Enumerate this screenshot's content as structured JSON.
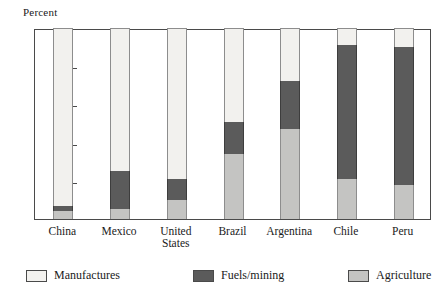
{
  "chart_data": {
    "type": "bar",
    "title": "",
    "subtitle": "",
    "xlabel": "",
    "ylabel": "Percent",
    "ylim": [
      0,
      100
    ],
    "yticks": [
      20,
      40,
      60,
      80
    ],
    "ytick_labels": [
      "20",
      "40",
      "60",
      "80"
    ],
    "grid": false,
    "stacked": true,
    "legend_position": "bottom",
    "categories": [
      "China",
      "Mexico",
      "United States",
      "Brazil",
      "Argentina",
      "Chile",
      "Peru"
    ],
    "category_labels": [
      [
        "China"
      ],
      [
        "Mexico"
      ],
      [
        "United",
        "States"
      ],
      [
        "Brazil"
      ],
      [
        "Argentina"
      ],
      [
        "Chile"
      ],
      [
        "Peru"
      ]
    ],
    "series": [
      {
        "name": "Agriculture",
        "color": "#c4c4c2",
        "values": [
          4,
          5,
          10,
          34,
          47,
          21,
          18
        ]
      },
      {
        "name": "Fuels/mining",
        "color": "#5b5b5b",
        "values": [
          3,
          20,
          11,
          17,
          25,
          70,
          72
        ]
      },
      {
        "name": "Manufactures",
        "color": "#f2f1ee",
        "values": [
          93,
          75,
          79,
          49,
          28,
          9,
          10
        ]
      }
    ]
  },
  "legend": {
    "items": [
      {
        "label": "Manufactures",
        "swatch": "manu"
      },
      {
        "label": "Fuels/mining",
        "swatch": "fuel"
      },
      {
        "label": "Agriculture",
        "swatch": "agri"
      }
    ]
  }
}
